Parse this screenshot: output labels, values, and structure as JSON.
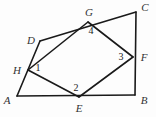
{
  "figure": {
    "type": "geometry-diagram",
    "canvas": {
      "width": 156,
      "height": 117,
      "background": "#fdfdfd"
    },
    "stroke": {
      "color": "#1a1a1a",
      "width": 1.6
    },
    "points": [
      {
        "id": "A",
        "label": "A",
        "x": 17,
        "y": 96,
        "label_x": 7,
        "label_y": 100,
        "kind": "outer-vertex"
      },
      {
        "id": "B",
        "label": "B",
        "x": 135,
        "y": 95,
        "label_x": 144,
        "label_y": 100,
        "kind": "outer-vertex"
      },
      {
        "id": "C",
        "label": "C",
        "x": 136,
        "y": 12,
        "label_x": 145,
        "label_y": 7,
        "kind": "outer-vertex"
      },
      {
        "id": "D",
        "label": "D",
        "x": 40,
        "y": 41,
        "label_x": 31,
        "label_y": 40,
        "kind": "outer-vertex"
      },
      {
        "id": "E",
        "label": "E",
        "x": 79,
        "y": 97,
        "label_x": 79,
        "label_y": 108,
        "kind": "side-point"
      },
      {
        "id": "F",
        "label": "F",
        "x": 133,
        "y": 57,
        "label_x": 144,
        "label_y": 57,
        "kind": "side-point"
      },
      {
        "id": "G",
        "label": "G",
        "x": 88,
        "y": 22,
        "label_x": 89,
        "label_y": 12,
        "kind": "side-point"
      },
      {
        "id": "H",
        "label": "H",
        "x": 28,
        "y": 70,
        "label_x": 17,
        "label_y": 70,
        "kind": "side-point"
      }
    ],
    "segments": [
      {
        "id": "AB",
        "from": "A",
        "to": "B",
        "role": "outer-side"
      },
      {
        "id": "BC",
        "from": "B",
        "to": "C",
        "role": "outer-side"
      },
      {
        "id": "CD",
        "from": "C",
        "to": "D",
        "role": "outer-side"
      },
      {
        "id": "DA",
        "from": "D",
        "to": "A",
        "role": "outer-side"
      },
      {
        "id": "HE",
        "from": "H",
        "to": "E",
        "role": "inner-side"
      },
      {
        "id": "EF",
        "from": "E",
        "to": "F",
        "role": "inner-side"
      },
      {
        "id": "FG",
        "from": "F",
        "to": "G",
        "role": "inner-side"
      },
      {
        "id": "GH",
        "from": "G",
        "to": "H",
        "role": "inner-side"
      }
    ],
    "angle_labels": [
      {
        "id": "angle-1",
        "label": "1",
        "x": 38,
        "y": 68,
        "at_vertex": "H"
      },
      {
        "id": "angle-2",
        "label": "2",
        "x": 76,
        "y": 88,
        "at_vertex": "E"
      },
      {
        "id": "angle-3",
        "label": "3",
        "x": 121,
        "y": 57,
        "at_vertex": "F"
      },
      {
        "id": "angle-4",
        "label": "4",
        "x": 91,
        "y": 31,
        "at_vertex": "G"
      }
    ]
  }
}
